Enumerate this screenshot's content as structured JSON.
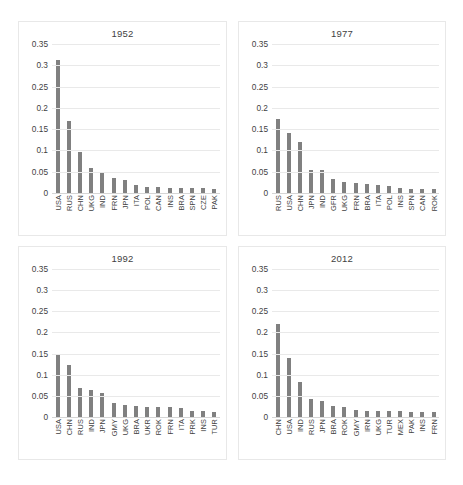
{
  "figure": {
    "panel_count": 4,
    "bar_color": "#808080",
    "gridline_color": "#e9e9e9",
    "axis_color": "#d6d6d6",
    "background": "#ffffff"
  },
  "chart_data": [
    {
      "type": "bar",
      "title": "1952",
      "xlabel": "",
      "ylabel": "",
      "ylim": [
        0,
        0.35
      ],
      "yticks": [
        0,
        0.05,
        0.1,
        0.15,
        0.2,
        0.25,
        0.3,
        0.35
      ],
      "ytick_labels": [
        "0",
        "0.05",
        "0.1",
        "0.15",
        "0.2",
        "0.25",
        "0.3",
        "0.35"
      ],
      "grid": true,
      "legend": "none",
      "categories": [
        "USA",
        "RUS",
        "CHN",
        "UKG",
        "IND",
        "FRN",
        "JPN",
        "ITA",
        "POL",
        "CAN",
        "INS",
        "BRA",
        "SPN",
        "CZE",
        "PAK"
      ],
      "values": [
        0.312,
        0.17,
        0.097,
        0.058,
        0.048,
        0.035,
        0.031,
        0.018,
        0.015,
        0.014,
        0.012,
        0.012,
        0.011,
        0.011,
        0.01
      ]
    },
    {
      "type": "bar",
      "title": "1977",
      "xlabel": "",
      "ylabel": "",
      "ylim": [
        0,
        0.35
      ],
      "yticks": [
        0,
        0.05,
        0.1,
        0.15,
        0.2,
        0.25,
        0.3,
        0.35
      ],
      "ytick_labels": [
        "0",
        "0.05",
        "0.1",
        "0.15",
        "0.2",
        "0.25",
        "0.3",
        "0.35"
      ],
      "grid": true,
      "legend": "none",
      "categories": [
        "RUS",
        "USA",
        "CHN",
        "JPN",
        "IND",
        "GFR",
        "UKG",
        "FRN",
        "BRA",
        "ITA",
        "POL",
        "INS",
        "SPN",
        "CAN",
        "ROK"
      ],
      "values": [
        0.174,
        0.142,
        0.119,
        0.054,
        0.053,
        0.033,
        0.026,
        0.023,
        0.021,
        0.02,
        0.017,
        0.011,
        0.01,
        0.01,
        0.01
      ]
    },
    {
      "type": "bar",
      "title": "1992",
      "xlabel": "",
      "ylabel": "",
      "ylim": [
        0,
        0.35
      ],
      "yticks": [
        0,
        0.05,
        0.1,
        0.15,
        0.2,
        0.25,
        0.3,
        0.35
      ],
      "ytick_labels": [
        "0",
        "0.05",
        "0.1",
        "0.15",
        "0.2",
        "0.25",
        "0.3",
        "0.35"
      ],
      "grid": true,
      "legend": "none",
      "categories": [
        "USA",
        "CHN",
        "RUS",
        "IND",
        "JPN",
        "GMY",
        "UKG",
        "BRA",
        "UKR",
        "ROK",
        "FRN",
        "ITA",
        "PRK",
        "INS",
        "TUR"
      ],
      "values": [
        0.148,
        0.124,
        0.068,
        0.065,
        0.056,
        0.032,
        0.028,
        0.025,
        0.024,
        0.024,
        0.023,
        0.022,
        0.014,
        0.014,
        0.013
      ]
    },
    {
      "type": "bar",
      "title": "2012",
      "xlabel": "",
      "ylabel": "",
      "ylim": [
        0,
        0.35
      ],
      "yticks": [
        0,
        0.05,
        0.1,
        0.15,
        0.2,
        0.25,
        0.3,
        0.35
      ],
      "ytick_labels": [
        "0",
        "0.05",
        "0.1",
        "0.15",
        "0.2",
        "0.25",
        "0.3",
        "0.35"
      ],
      "grid": true,
      "legend": "none",
      "categories": [
        "CHN",
        "USA",
        "IND",
        "RUS",
        "JPN",
        "BRA",
        "ROK",
        "GMY",
        "IRN",
        "UKG",
        "TUR",
        "MEX",
        "PAK",
        "INS",
        "FRN"
      ],
      "values": [
        0.219,
        0.14,
        0.082,
        0.042,
        0.037,
        0.025,
        0.023,
        0.016,
        0.015,
        0.015,
        0.014,
        0.014,
        0.013,
        0.013,
        0.012
      ]
    }
  ]
}
